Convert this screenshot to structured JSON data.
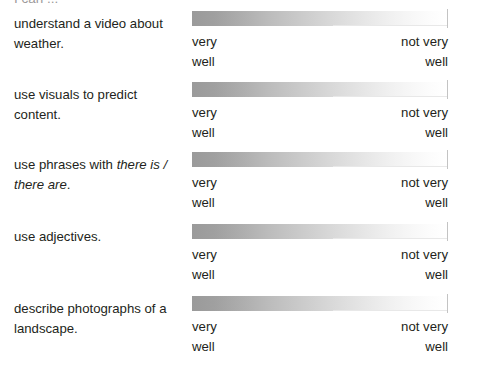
{
  "document": {
    "heading": "I can ..."
  },
  "scale": {
    "low_label": "very\nwell",
    "high_label": "not very\nwell",
    "gradient_from": "#9a9a9a",
    "gradient_to": "#ffffff",
    "border_color": "#c3c3c3"
  },
  "rows": [
    {
      "id": "understand-a-video-about-weather",
      "statement_parts": [
        {
          "text": "understand a video about weather.",
          "italic": false
        }
      ],
      "low_label": "very\nwell",
      "high_label": "not very\nwell"
    },
    {
      "id": "use-visuals-to-predict-content",
      "statement_parts": [
        {
          "text": "use visuals to predict content.",
          "italic": false
        }
      ],
      "low_label": "very\nwell",
      "high_label": "not very\nwell"
    },
    {
      "id": "use-phrases-with-there-is-there-are",
      "statement_parts": [
        {
          "text": "use phrases with ",
          "italic": false
        },
        {
          "text": "there is / there are",
          "italic": true
        },
        {
          "text": ".",
          "italic": false
        }
      ],
      "low_label": "very\nwell",
      "high_label": "not very\nwell"
    },
    {
      "id": "use-adjectives",
      "statement_parts": [
        {
          "text": "use adjectives.",
          "italic": false
        }
      ],
      "low_label": "very\nwell",
      "high_label": "not very\nwell"
    },
    {
      "id": "describe-photographs-of-a-landscape",
      "statement_parts": [
        {
          "text": "describe photographs of a landscape.",
          "italic": false
        }
      ],
      "low_label": "very\nwell",
      "high_label": "not very\nwell"
    }
  ]
}
